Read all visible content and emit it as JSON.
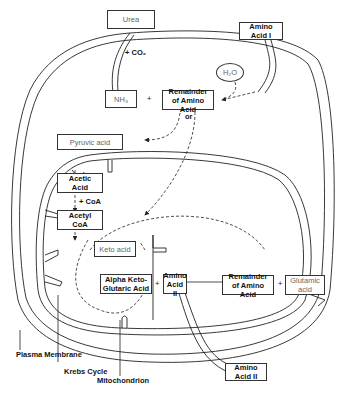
{
  "diagram": {
    "nodes": {
      "urea": "Urea",
      "co2": "+ CO₂",
      "nh3": "NH₃",
      "plus1": "+",
      "remainder_top": [
        "Remainder",
        "of Amino Acid"
      ],
      "or": "or",
      "amino_acid_1": [
        "Amino",
        "Acid I"
      ],
      "h2o": "H₂O",
      "pyruvic_acid": "Pyruvic acid",
      "acetic_acid": [
        "Acetic",
        "Acid"
      ],
      "coa": "+ CoA",
      "acetyl_coa": [
        "Acetyl",
        "CoA"
      ],
      "keto_acid": "Keto acid",
      "alpha_keto": [
        "Alpha Keto-",
        "Glutaric Acid"
      ],
      "plus2": "+",
      "amino_acid_2": [
        "Amino",
        "Acid II"
      ],
      "remainder_bottom": [
        "Remainder",
        "of Amino Acid"
      ],
      "plus3": "+",
      "glutamic_acid": [
        "Glutamic",
        "acid"
      ],
      "amino_acid_2_outside": [
        "Amino",
        "Acid II"
      ]
    },
    "labels": {
      "plasma_membrane": "Plasma Membrane",
      "krebs_cycle": "Krebs Cycle",
      "mitochondrion": "Mitochondrion"
    }
  }
}
